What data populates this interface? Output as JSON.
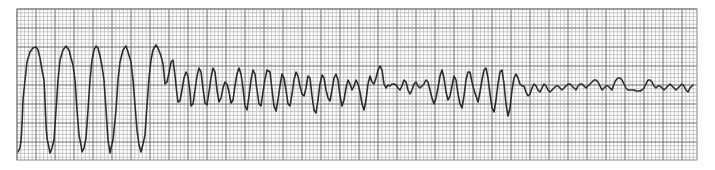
{
  "chart_data": {
    "type": "line",
    "title": "",
    "xlabel": "",
    "ylabel": "",
    "grid": {
      "on": true,
      "left": 17,
      "top": 9,
      "right": 697,
      "bottom": 160,
      "minor_spacing": 3.8,
      "major_every": 5,
      "minor_color": "#b4b4b4",
      "major_color": "#6e6e6e",
      "border_color": "#888888"
    },
    "trace_color": "#2b2b2b",
    "trace_width": 1.6,
    "points": [
      [
        18,
        152
      ],
      [
        20,
        148
      ],
      [
        21,
        141
      ],
      [
        22,
        125
      ],
      [
        23,
        100
      ],
      [
        25,
        80
      ],
      [
        27,
        62
      ],
      [
        30,
        52
      ],
      [
        33,
        48
      ],
      [
        36,
        47
      ],
      [
        38,
        50
      ],
      [
        40,
        58
      ],
      [
        42,
        70
      ],
      [
        44,
        80
      ],
      [
        45,
        100
      ],
      [
        46,
        125
      ],
      [
        47,
        138
      ],
      [
        49,
        148
      ],
      [
        50,
        153
      ],
      [
        52,
        148
      ],
      [
        54,
        140
      ],
      [
        56,
        110
      ],
      [
        58,
        80
      ],
      [
        60,
        60
      ],
      [
        63,
        50
      ],
      [
        66,
        46
      ],
      [
        69,
        50
      ],
      [
        71,
        58
      ],
      [
        73,
        65
      ],
      [
        75,
        80
      ],
      [
        77,
        110
      ],
      [
        79,
        135
      ],
      [
        81,
        145
      ],
      [
        82,
        152
      ],
      [
        84,
        148
      ],
      [
        86,
        138
      ],
      [
        88,
        110
      ],
      [
        90,
        80
      ],
      [
        92,
        60
      ],
      [
        94,
        50
      ],
      [
        96,
        46
      ],
      [
        98,
        48
      ],
      [
        100,
        56
      ],
      [
        102,
        66
      ],
      [
        104,
        80
      ],
      [
        106,
        110
      ],
      [
        108,
        140
      ],
      [
        110,
        153
      ],
      [
        111,
        148
      ],
      [
        113,
        140
      ],
      [
        116,
        110
      ],
      [
        118,
        80
      ],
      [
        120,
        62
      ],
      [
        123,
        50
      ],
      [
        126,
        46
      ],
      [
        128,
        52
      ],
      [
        131,
        62
      ],
      [
        133,
        80
      ],
      [
        135,
        105
      ],
      [
        137,
        130
      ],
      [
        139,
        145
      ],
      [
        141,
        152
      ],
      [
        143,
        144
      ],
      [
        145,
        135
      ],
      [
        147,
        105
      ],
      [
        149,
        78
      ],
      [
        151,
        60
      ],
      [
        153,
        50
      ],
      [
        156,
        45
      ],
      [
        158,
        48
      ],
      [
        161,
        56
      ],
      [
        163,
        64
      ],
      [
        165,
        84
      ],
      [
        167,
        82
      ],
      [
        169,
        73
      ],
      [
        171,
        62
      ],
      [
        173,
        60
      ],
      [
        175,
        75
      ],
      [
        177,
        95
      ],
      [
        178,
        102
      ],
      [
        180,
        101
      ],
      [
        182,
        90
      ],
      [
        184,
        78
      ],
      [
        186,
        72
      ],
      [
        188,
        76
      ],
      [
        190,
        92
      ],
      [
        191,
        106
      ],
      [
        193,
        104
      ],
      [
        195,
        90
      ],
      [
        197,
        76
      ],
      [
        199,
        68
      ],
      [
        201,
        72
      ],
      [
        203,
        88
      ],
      [
        205,
        103
      ],
      [
        207,
        105
      ],
      [
        209,
        92
      ],
      [
        211,
        78
      ],
      [
        213,
        68
      ],
      [
        215,
        72
      ],
      [
        217,
        90
      ],
      [
        219,
        102
      ],
      [
        221,
        98
      ],
      [
        223,
        88
      ],
      [
        225,
        82
      ],
      [
        227,
        84
      ],
      [
        229,
        92
      ],
      [
        231,
        103
      ],
      [
        233,
        100
      ],
      [
        235,
        86
      ],
      [
        237,
        74
      ],
      [
        239,
        68
      ],
      [
        241,
        74
      ],
      [
        243,
        88
      ],
      [
        245,
        106
      ],
      [
        247,
        110
      ],
      [
        249,
        96
      ],
      [
        251,
        80
      ],
      [
        253,
        70
      ],
      [
        255,
        74
      ],
      [
        257,
        90
      ],
      [
        259,
        104
      ],
      [
        261,
        106
      ],
      [
        263,
        92
      ],
      [
        265,
        79
      ],
      [
        267,
        70
      ],
      [
        270,
        72
      ],
      [
        272,
        90
      ],
      [
        274,
        106
      ],
      [
        276,
        111
      ],
      [
        278,
        100
      ],
      [
        280,
        86
      ],
      [
        282,
        74
      ],
      [
        284,
        78
      ],
      [
        286,
        90
      ],
      [
        288,
        104
      ],
      [
        290,
        106
      ],
      [
        292,
        94
      ],
      [
        294,
        80
      ],
      [
        296,
        72
      ],
      [
        298,
        76
      ],
      [
        300,
        86
      ],
      [
        302,
        94
      ],
      [
        304,
        96
      ],
      [
        306,
        88
      ],
      [
        308,
        76
      ],
      [
        310,
        78
      ],
      [
        312,
        96
      ],
      [
        314,
        110
      ],
      [
        316,
        113
      ],
      [
        318,
        100
      ],
      [
        320,
        84
      ],
      [
        322,
        75
      ],
      [
        324,
        78
      ],
      [
        326,
        90
      ],
      [
        328,
        98
      ],
      [
        330,
        101
      ],
      [
        332,
        90
      ],
      [
        334,
        78
      ],
      [
        336,
        74
      ],
      [
        338,
        80
      ],
      [
        340,
        96
      ],
      [
        342,
        106
      ],
      [
        344,
        100
      ],
      [
        346,
        88
      ],
      [
        348,
        80
      ],
      [
        350,
        84
      ],
      [
        352,
        90
      ],
      [
        354,
        86
      ],
      [
        356,
        80
      ],
      [
        358,
        84
      ],
      [
        360,
        92
      ],
      [
        362,
        104
      ],
      [
        364,
        110
      ],
      [
        366,
        100
      ],
      [
        368,
        84
      ],
      [
        370,
        76
      ],
      [
        372,
        82
      ],
      [
        374,
        84
      ],
      [
        376,
        78
      ],
      [
        378,
        70
      ],
      [
        380,
        66
      ],
      [
        382,
        70
      ],
      [
        384,
        84
      ],
      [
        386,
        88
      ],
      [
        388,
        85
      ],
      [
        390,
        86
      ],
      [
        392,
        84
      ],
      [
        394,
        84
      ],
      [
        396,
        85
      ],
      [
        398,
        88
      ],
      [
        400,
        90
      ],
      [
        402,
        86
      ],
      [
        404,
        80
      ],
      [
        406,
        82
      ],
      [
        408,
        90
      ],
      [
        410,
        94
      ],
      [
        412,
        90
      ],
      [
        414,
        84
      ],
      [
        416,
        82
      ],
      [
        418,
        86
      ],
      [
        420,
        88
      ],
      [
        422,
        86
      ],
      [
        424,
        84
      ],
      [
        426,
        80
      ],
      [
        428,
        82
      ],
      [
        430,
        90
      ],
      [
        432,
        98
      ],
      [
        434,
        104
      ],
      [
        436,
        98
      ],
      [
        438,
        88
      ],
      [
        440,
        76
      ],
      [
        442,
        70
      ],
      [
        444,
        78
      ],
      [
        446,
        92
      ],
      [
        448,
        100
      ],
      [
        450,
        96
      ],
      [
        452,
        86
      ],
      [
        454,
        76
      ],
      [
        456,
        80
      ],
      [
        458,
        94
      ],
      [
        460,
        104
      ],
      [
        462,
        108
      ],
      [
        464,
        96
      ],
      [
        466,
        80
      ],
      [
        468,
        72
      ],
      [
        470,
        72
      ],
      [
        472,
        82
      ],
      [
        474,
        90
      ],
      [
        476,
        96
      ],
      [
        478,
        102
      ],
      [
        480,
        92
      ],
      [
        482,
        80
      ],
      [
        484,
        70
      ],
      [
        486,
        68
      ],
      [
        488,
        78
      ],
      [
        490,
        94
      ],
      [
        492,
        108
      ],
      [
        494,
        112
      ],
      [
        496,
        100
      ],
      [
        498,
        84
      ],
      [
        500,
        72
      ],
      [
        502,
        70
      ],
      [
        504,
        84
      ],
      [
        506,
        104
      ],
      [
        508,
        116
      ],
      [
        510,
        108
      ],
      [
        512,
        90
      ],
      [
        514,
        78
      ],
      [
        516,
        74
      ],
      [
        518,
        78
      ],
      [
        520,
        84
      ],
      [
        522,
        86
      ],
      [
        524,
        86
      ],
      [
        526,
        92
      ],
      [
        528,
        96
      ],
      [
        530,
        94
      ],
      [
        532,
        88
      ],
      [
        534,
        84
      ],
      [
        536,
        86
      ],
      [
        538,
        90
      ],
      [
        540,
        92
      ],
      [
        542,
        88
      ],
      [
        544,
        84
      ],
      [
        546,
        86
      ],
      [
        548,
        90
      ],
      [
        550,
        92
      ],
      [
        552,
        90
      ],
      [
        554,
        88
      ],
      [
        556,
        86
      ],
      [
        558,
        86
      ],
      [
        560,
        88
      ],
      [
        562,
        90
      ],
      [
        564,
        88
      ],
      [
        566,
        86
      ],
      [
        568,
        84
      ],
      [
        570,
        84
      ],
      [
        572,
        86
      ],
      [
        574,
        88
      ],
      [
        576,
        90
      ],
      [
        578,
        86
      ],
      [
        580,
        84
      ],
      [
        582,
        84
      ],
      [
        584,
        86
      ],
      [
        586,
        88
      ],
      [
        588,
        86
      ],
      [
        590,
        84
      ],
      [
        592,
        82
      ],
      [
        594,
        80
      ],
      [
        596,
        80
      ],
      [
        598,
        82
      ],
      [
        600,
        86
      ],
      [
        602,
        90
      ],
      [
        604,
        88
      ],
      [
        606,
        86
      ],
      [
        608,
        86
      ],
      [
        610,
        88
      ],
      [
        612,
        90
      ],
      [
        614,
        84
      ],
      [
        616,
        80
      ],
      [
        618,
        78
      ],
      [
        620,
        78
      ],
      [
        622,
        80
      ],
      [
        624,
        84
      ],
      [
        626,
        88
      ],
      [
        628,
        90
      ],
      [
        630,
        90
      ],
      [
        632,
        90
      ],
      [
        634,
        90
      ],
      [
        636,
        91
      ],
      [
        638,
        91
      ],
      [
        640,
        91
      ],
      [
        642,
        90
      ],
      [
        644,
        88
      ],
      [
        646,
        84
      ],
      [
        648,
        80
      ],
      [
        650,
        80
      ],
      [
        652,
        82
      ],
      [
        654,
        86
      ],
      [
        656,
        88
      ],
      [
        658,
        86
      ],
      [
        660,
        86
      ],
      [
        662,
        88
      ],
      [
        664,
        90
      ],
      [
        666,
        88
      ],
      [
        668,
        86
      ],
      [
        670,
        84
      ],
      [
        672,
        86
      ],
      [
        674,
        88
      ],
      [
        676,
        90
      ],
      [
        678,
        88
      ],
      [
        680,
        86
      ],
      [
        682,
        84
      ],
      [
        684,
        86
      ],
      [
        686,
        90
      ],
      [
        688,
        92
      ],
      [
        690,
        88
      ],
      [
        692,
        86
      ],
      [
        693,
        85
      ]
    ]
  }
}
